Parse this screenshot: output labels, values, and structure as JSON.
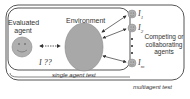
{
  "diagram": {
    "evaluated_agent": {
      "label_line1": "Evaluated",
      "label_line2": "agent"
    },
    "environment": {
      "label": "Environment"
    },
    "interaction_label": "I ??",
    "single_agent_box": {
      "label": "single agent test"
    },
    "multiagent_box": {
      "label": "multiagent test"
    },
    "other_agents": [
      {
        "label": "I",
        "subscript": "1"
      },
      {
        "label": "I",
        "subscript": "2"
      },
      {
        "label": "I",
        "subscript": "m"
      }
    ],
    "other_agents_caption": {
      "line1": "Competing or",
      "line2": "collaborating",
      "line3": "agents"
    },
    "colors": {
      "environment_fill": "#a8a8a8",
      "agent_fill": "#b0b0b0",
      "stroke": "#444444",
      "text": "#333333"
    }
  }
}
